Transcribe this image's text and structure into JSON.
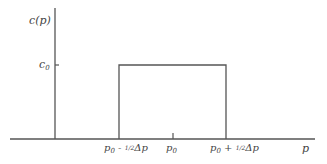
{
  "diagram": {
    "type": "rectangular-distribution",
    "y_axis_label": "c(p)",
    "x_axis_label": "p",
    "level_label": {
      "base": "c",
      "sub": "0"
    },
    "x_ticks": [
      {
        "id": "left",
        "base": "p",
        "sub": "0",
        "op": " - ",
        "frac": "1/2",
        "delta": "Δp"
      },
      {
        "id": "center",
        "base": "p",
        "sub": "0"
      },
      {
        "id": "right",
        "base": "p",
        "sub": "0",
        "op": " + ",
        "frac": "1/2",
        "delta": "Δp"
      }
    ],
    "colors": {
      "line": "#555555",
      "text": "#444444",
      "background": "#ffffff"
    }
  }
}
